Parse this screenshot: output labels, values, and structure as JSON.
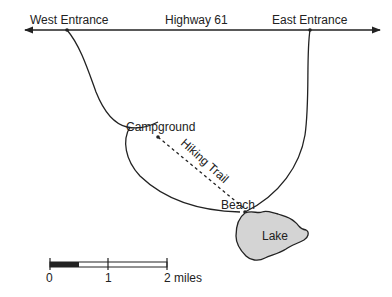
{
  "map": {
    "road": {
      "name": "Highway 61"
    },
    "places": {
      "west_entrance": "West Entrance",
      "east_entrance": "East Entrance",
      "campground": "Campground",
      "beach": "Beach",
      "lake": "Lake"
    },
    "trail": {
      "name": "Hiking Trail"
    },
    "scale": {
      "ticks": [
        "0",
        "1",
        "2 miles"
      ]
    },
    "colors": {
      "line": "#222222",
      "lake_fill": "#d4d4d4",
      "background": "#ffffff"
    }
  }
}
